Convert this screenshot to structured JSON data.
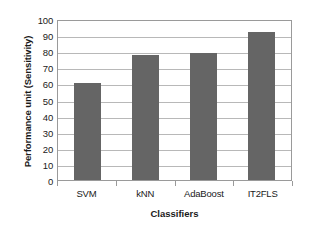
{
  "chart_data": {
    "type": "bar",
    "title": "",
    "categories": [
      "SVM",
      "kNN",
      "AdaBoost",
      "IT2FLS"
    ],
    "values": [
      60,
      77.5,
      79,
      92
    ],
    "xlabel": "Classifiers",
    "ylabel": "Performance unit (Sensitivity)",
    "ylim": [
      0,
      100
    ],
    "ytick_step": 10,
    "yticks": [
      100,
      90,
      80,
      70,
      60,
      50,
      40,
      30,
      20,
      10,
      0
    ],
    "ytick_labels": [
      "100",
      "90",
      "80",
      "70",
      "60",
      "50",
      "40",
      "30",
      "20",
      "10",
      "0"
    ],
    "grid": true,
    "grid_axis": "y",
    "legend": false,
    "legend_position": "none",
    "bar_color": "#656565",
    "grid_color": "#b8b8b8",
    "axis_color": "#9a9a9a",
    "background_color": "#ffffff",
    "text_color": "#1a1a1a"
  }
}
